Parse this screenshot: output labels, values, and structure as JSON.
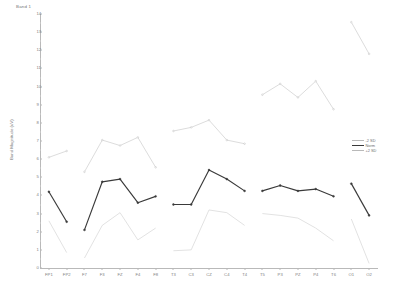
{
  "chart_title": "Band 1",
  "axes": {
    "ylabel": "Band Magnitude (uV)",
    "ylim": [
      0,
      14
    ],
    "yticks": [
      0,
      1,
      2,
      3,
      4,
      5,
      6,
      7,
      8,
      9,
      10,
      11,
      12,
      13,
      14
    ],
    "ytick_labels": [
      "0",
      "1",
      "2",
      "3",
      "4",
      "5",
      "6",
      "7",
      "8",
      "9",
      "10",
      "11",
      "12",
      "13",
      "14"
    ],
    "xlabel": "",
    "grid": false
  },
  "legend": {
    "position": "right",
    "entries": [
      {
        "label": "-2 SD",
        "color": "#b9b9b9",
        "style": "thin"
      },
      {
        "label": "Norm",
        "color": "#3a3a3a",
        "style": "thick"
      },
      {
        "label": "+2 SD",
        "color": "#b9b9b9",
        "style": "thin"
      }
    ]
  },
  "chart_data": {
    "type": "line",
    "title": "Band 1",
    "xlabel": "",
    "ylabel": "Band Magnitude (uV)",
    "ylim": [
      0,
      14
    ],
    "grid": false,
    "legend_position": "right",
    "categories": [
      "FP1",
      "FP2",
      "F7",
      "F3",
      "FZ",
      "F4",
      "F8",
      "T3",
      "C3",
      "CZ",
      "C4",
      "T4",
      "T5",
      "P3",
      "PZ",
      "P4",
      "T6",
      "O1",
      "O2"
    ],
    "groups": [
      {
        "name": "frontopolar",
        "channels": [
          "FP1",
          "FP2"
        ]
      },
      {
        "name": "frontal",
        "channels": [
          "F7",
          "F3",
          "FZ",
          "F4",
          "F8"
        ]
      },
      {
        "name": "central",
        "channels": [
          "T3",
          "C3",
          "CZ",
          "C4",
          "T4"
        ]
      },
      {
        "name": "parietal",
        "channels": [
          "T5",
          "P3",
          "PZ",
          "P4",
          "T6"
        ]
      },
      {
        "name": "occipital",
        "channels": [
          "O1",
          "O2"
        ]
      }
    ],
    "series": [
      {
        "name": "+2 SD",
        "color": "#b9b9b9",
        "markers": true,
        "values": [
          6.1,
          6.45,
          5.3,
          7.05,
          6.75,
          7.2,
          5.55,
          7.55,
          7.75,
          8.15,
          7.05,
          6.85,
          9.55,
          10.15,
          9.4,
          10.3,
          8.75,
          13.55,
          11.8
        ]
      },
      {
        "name": "Norm",
        "color": "#3a3a3a",
        "markers": true,
        "values": [
          4.2,
          2.55,
          2.1,
          4.75,
          4.9,
          3.6,
          3.95,
          3.5,
          3.5,
          5.4,
          4.9,
          4.25,
          4.25,
          4.55,
          4.25,
          4.35,
          3.95,
          4.65,
          2.9
        ]
      },
      {
        "name": "-2 SD",
        "color": "#c4c4c4",
        "markers": false,
        "values": [
          2.6,
          0.85,
          0.55,
          2.35,
          3.05,
          1.55,
          2.2,
          0.95,
          1.0,
          3.2,
          3.05,
          2.35,
          3.0,
          2.9,
          2.75,
          2.2,
          1.5,
          2.7,
          0.25
        ]
      }
    ]
  }
}
